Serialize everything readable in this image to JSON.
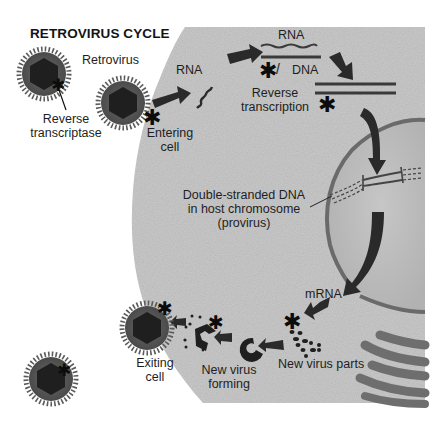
{
  "diagram": {
    "title": "RETROVIRUS CYCLE",
    "colors": {
      "background": "#ffffff",
      "cytoplasm": "#c9c9c9",
      "nucleus": "#bdbdbd",
      "arrow": "#2a2a2a",
      "virus_envelope": "#5a5a5a",
      "virus_core": "#1f1f1f",
      "text": "#1e1e1e"
    },
    "labels": {
      "retrovirus": "Retrovirus",
      "reverse_transcriptase_1": "Reverse",
      "reverse_transcriptase_2": "transcriptase",
      "rna_entry": "RNA",
      "entering_1": "Entering",
      "entering_2": "cell",
      "rna_top": "RNA",
      "dna_top": "DNA",
      "reverse_transcription_1": "Reverse",
      "reverse_transcription_2": "transcription",
      "provirus_1": "Double-stranded DNA",
      "provirus_2": "in host chromosome",
      "provirus_3": "(provirus)",
      "mrna": "mRNA",
      "new_parts": "New virus parts",
      "forming_1": "New virus",
      "forming_2": "forming",
      "exiting_1": "Exiting",
      "exiting_2": "cell"
    },
    "markers": {
      "asterisk": "✱"
    },
    "stages": [
      "Retrovirus",
      "Entering cell",
      "Reverse transcription",
      "Double-stranded DNA in host chromosome (provirus)",
      "mRNA",
      "New virus parts",
      "New virus forming",
      "Exiting cell"
    ]
  }
}
